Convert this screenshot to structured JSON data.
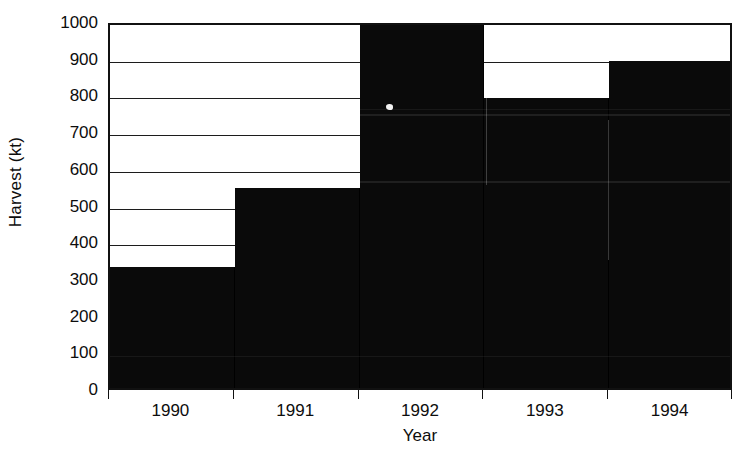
{
  "chart_data": {
    "type": "bar",
    "title": "",
    "xlabel": "Year",
    "ylabel": "Harvest (kt)",
    "categories": [
      "1990",
      "1991",
      "1992",
      "1993",
      "1994"
    ],
    "values": [
      330,
      545,
      990,
      790,
      890
    ],
    "ylim": [
      0,
      1000
    ],
    "yticks": [
      0,
      100,
      200,
      300,
      400,
      500,
      600,
      700,
      800,
      900,
      1000
    ],
    "ytick_labels": [
      "0",
      "100",
      "200",
      "300",
      "400",
      "500",
      "600",
      "700",
      "800",
      "900",
      "1000"
    ],
    "grid": true,
    "grid_axis": "y",
    "legend": false,
    "bar_color": "#0a0a0a",
    "bar_gap": 0,
    "axis_color": "#111111",
    "background": "#ffffff",
    "note": "scanned monochrome bar chart; bars abut with no gap"
  },
  "axes": {
    "y_title": "Harvest (kt)",
    "x_title": "Year"
  }
}
